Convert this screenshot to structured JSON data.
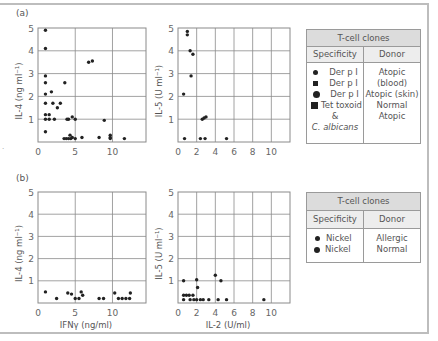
{
  "panels": {
    "a": {
      "label": "(a)"
    },
    "b": {
      "label": "(b)"
    }
  },
  "legends": {
    "a": {
      "title": "T-cell clones",
      "col_specificity": "Specificity",
      "col_donor": "Donor",
      "rows": [
        {
          "marker": "small-circle",
          "specificity": "Der p I",
          "donor": "Atopic (blood)"
        },
        {
          "marker": "small-square",
          "specificity": "Der p I",
          "donor": "Atopic (skin)"
        },
        {
          "marker": "large-circle",
          "specificity": "Der p I",
          "donor": "Normal"
        },
        {
          "marker": "large-square",
          "specificity": "Tet toxoid",
          "donor": "Atopic"
        }
      ],
      "extra_lines": [
        "&",
        "C. albicans"
      ]
    },
    "b": {
      "title": "T-cell clones",
      "col_specificity": "Specificity",
      "col_donor": "Donor",
      "rows": [
        {
          "marker": "small-circle",
          "specificity": "Nickel",
          "donor": "Allergic"
        },
        {
          "marker": "large-circle",
          "specificity": "Nickel",
          "donor": "Normal"
        }
      ]
    }
  },
  "chart_data": [
    {
      "id": "a-left",
      "type": "scatter",
      "title": "",
      "xlabel": "",
      "ylabel": "IL-4 (ng ml⁻¹)",
      "xlim": [
        0,
        14.5
      ],
      "ylim": [
        0,
        5
      ],
      "xticks": [
        0,
        5,
        10
      ],
      "yticks": [
        1,
        2,
        3,
        4,
        5
      ],
      "grid": true,
      "points": [
        [
          1,
          4.9
        ],
        [
          1,
          4.1
        ],
        [
          1,
          2.9
        ],
        [
          1,
          2.6
        ],
        [
          1,
          2.1
        ],
        [
          1,
          1.7
        ],
        [
          1,
          1.2
        ],
        [
          1,
          1.0
        ],
        [
          1,
          0.45
        ],
        [
          1.5,
          1.2
        ],
        [
          1.5,
          1.0
        ],
        [
          1.8,
          2.2
        ],
        [
          2,
          1.7
        ],
        [
          2.2,
          1.0
        ],
        [
          2.6,
          1.5
        ],
        [
          3,
          1.7
        ],
        [
          3.6,
          2.6
        ],
        [
          3.9,
          1.0
        ],
        [
          4.1,
          1.0
        ],
        [
          4.6,
          1.1
        ],
        [
          5,
          1.0
        ],
        [
          3.5,
          0.15
        ],
        [
          3.8,
          0.15
        ],
        [
          4.1,
          0.15
        ],
        [
          4.3,
          0.3
        ],
        [
          4.4,
          0.15
        ],
        [
          4.6,
          0.2
        ],
        [
          5,
          0.15
        ],
        [
          5.9,
          0.2
        ],
        [
          6.8,
          3.5
        ],
        [
          7.3,
          3.55
        ],
        [
          8.2,
          0.2
        ],
        [
          8.9,
          0.95
        ],
        [
          9.7,
          0.3
        ],
        [
          9.7,
          0.2
        ],
        [
          9.7,
          0.15
        ],
        [
          11.6,
          0.15
        ]
      ]
    },
    {
      "id": "a-right",
      "type": "scatter",
      "title": "",
      "xlabel": "",
      "ylabel": "IL-5 (U ml⁻¹)",
      "xlim": [
        0,
        12
      ],
      "ylim": [
        0,
        5
      ],
      "xticks": [
        0,
        2,
        4,
        6,
        8,
        10
      ],
      "yticks": [
        1,
        2,
        3,
        4,
        5
      ],
      "grid": true,
      "points": [
        [
          0.6,
          2.1
        ],
        [
          0.7,
          0.15
        ],
        [
          1.0,
          4.85
        ],
        [
          1.0,
          4.7
        ],
        [
          1.3,
          4.0
        ],
        [
          1.4,
          2.9
        ],
        [
          1.6,
          3.85
        ],
        [
          2.4,
          0.15
        ],
        [
          2.6,
          1.0
        ],
        [
          2.8,
          1.05
        ],
        [
          2.9,
          0.15
        ],
        [
          3.0,
          1.1
        ],
        [
          5.2,
          0.15
        ]
      ]
    },
    {
      "id": "b-left",
      "type": "scatter",
      "title": "",
      "xlabel": "IFNγ (ng/ml)",
      "ylabel": "IL-4 (ng ml⁻¹)",
      "xlim": [
        0,
        14.5
      ],
      "ylim": [
        0,
        5
      ],
      "xticks": [
        0,
        5,
        10
      ],
      "yticks": [
        1,
        2,
        3,
        4,
        5
      ],
      "grid": true,
      "points": [
        [
          1,
          0.5
        ],
        [
          2.5,
          0.2
        ],
        [
          4,
          0.45
        ],
        [
          4.5,
          0.4
        ],
        [
          5,
          0.2
        ],
        [
          5.5,
          0.2
        ],
        [
          5.8,
          0.5
        ],
        [
          6,
          0.35
        ],
        [
          8.2,
          0.2
        ],
        [
          8.8,
          0.2
        ],
        [
          10.3,
          0.45
        ],
        [
          10.8,
          0.2
        ],
        [
          11.3,
          0.2
        ],
        [
          11.8,
          0.2
        ],
        [
          12.3,
          0.2
        ],
        [
          12.4,
          0.45
        ]
      ]
    },
    {
      "id": "b-right",
      "type": "scatter",
      "title": "",
      "xlabel": "IL-2 (U/ml)",
      "ylabel": "IL-5 (U ml⁻¹)",
      "xlim": [
        0,
        12
      ],
      "ylim": [
        0,
        5
      ],
      "xticks": [
        0,
        2,
        4,
        6,
        8,
        10
      ],
      "yticks": [
        1,
        2,
        3,
        4,
        5
      ],
      "grid": true,
      "points": [
        [
          0.6,
          1.0
        ],
        [
          0.6,
          0.35
        ],
        [
          0.6,
          0.15
        ],
        [
          0.9,
          0.35
        ],
        [
          1.2,
          0.35
        ],
        [
          1.3,
          0.15
        ],
        [
          1.6,
          0.35
        ],
        [
          1.7,
          0.15
        ],
        [
          2.0,
          1.05
        ],
        [
          2.0,
          0.15
        ],
        [
          2.1,
          0.7
        ],
        [
          2.4,
          0.15
        ],
        [
          2.7,
          0.15
        ],
        [
          3.3,
          0.15
        ],
        [
          4.0,
          1.25
        ],
        [
          4.3,
          0.15
        ],
        [
          4.6,
          1.0
        ],
        [
          5.2,
          0.15
        ],
        [
          9.2,
          0.15
        ]
      ]
    }
  ]
}
